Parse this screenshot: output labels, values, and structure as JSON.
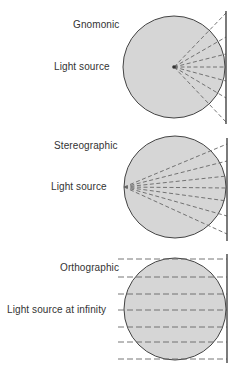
{
  "colors": {
    "globe_fill": "#d6d6d6",
    "stroke": "#444444",
    "dash": "#666666",
    "text": "#333333"
  },
  "panels": [
    {
      "name": "Gnomonic",
      "source_label": "Light source",
      "source_position": "center of sphere",
      "circle": {
        "cx": 174,
        "cy": 67,
        "r": 51
      },
      "plane": {
        "x": 226,
        "y1": 11,
        "y2": 124
      },
      "source": {
        "x": 174,
        "y": 67
      },
      "ray_end_y": [
        13,
        37,
        54,
        67,
        81,
        98,
        122
      ]
    },
    {
      "name": "Stereographic",
      "source_label": "Light source",
      "source_position": "opposite point on sphere surface",
      "circle": {
        "cx": 175,
        "cy": 187,
        "r": 51
      },
      "plane": {
        "x": 227,
        "y1": 138,
        "y2": 241
      },
      "source": {
        "x": 124,
        "y": 187
      },
      "ray_end_y": [
        144,
        161,
        176,
        188,
        201,
        216,
        234
      ]
    },
    {
      "name": "Orthographic",
      "source_label": "Light source at infinity",
      "source_position": "infinity",
      "circle": {
        "cx": 175,
        "cy": 309,
        "r": 51
      },
      "plane": {
        "x": 227,
        "y1": 254,
        "y2": 363
      },
      "parallel_lines_y": [
        259,
        277,
        294,
        310,
        327,
        342,
        359
      ],
      "line_start_x": 118
    }
  ]
}
